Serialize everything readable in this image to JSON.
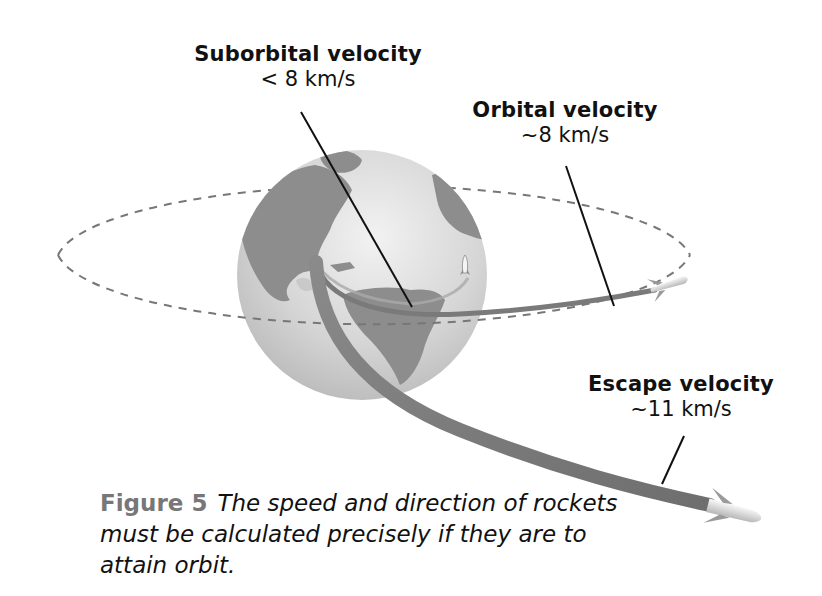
{
  "labels": {
    "suborbital": {
      "title": "Suborbital velocity",
      "value": "< 8 km/s"
    },
    "orbital": {
      "title": "Orbital velocity",
      "value": "~8 km/s"
    },
    "escape": {
      "title": "Escape velocity",
      "value": "~11 km/s"
    }
  },
  "caption": {
    "figure": "Figure 5",
    "text": "The speed and direction of rockets must be calculated precisely if they are to attain orbit."
  },
  "colors": {
    "globe": "#cfcfcf",
    "land": "#8a8a8a",
    "trajectory": "#7a7a7a",
    "orbit_dash": "#777777",
    "figure_label": "#777777"
  }
}
